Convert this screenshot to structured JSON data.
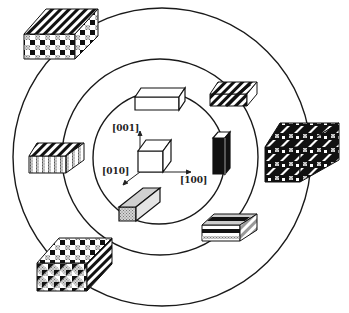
{
  "figure": {
    "type": "concentric-domain-diagram",
    "rings": [
      "inner",
      "middle",
      "outer"
    ],
    "axes": {
      "z_label": "[001]",
      "y_label": "[010]",
      "x_label": "[100]"
    },
    "inner_ring_blocks": [
      {
        "name": "unit-cube",
        "pattern": "plain-white"
      }
    ],
    "middle_ring_blocks": [
      {
        "name": "flat-plate-top",
        "pattern": "plain-white"
      },
      {
        "name": "tall-rod-right",
        "pattern": "solid-black"
      },
      {
        "name": "bar-bottom",
        "pattern": "grey-stipple"
      }
    ],
    "outer_ring_blocks": [
      {
        "name": "chevron-block-top-right",
        "pattern": "black-white-chevrons"
      },
      {
        "name": "striped-plate-bottom-right",
        "pattern": "horizontal-bands"
      },
      {
        "name": "vertical-stripe-block-left",
        "pattern": "vertical-stripes"
      }
    ],
    "outermost_blocks": [
      {
        "name": "checker-block-top-left",
        "pattern": "diagonal-checker"
      },
      {
        "name": "herringbone-block-right",
        "pattern": "herringbone"
      },
      {
        "name": "mosaic-block-bottom-left",
        "pattern": "mosaic"
      }
    ],
    "colors": {
      "line": "#1a1a1a",
      "grey": "#b8b8b8",
      "black": "#111111",
      "paper": "#ffffff"
    }
  }
}
